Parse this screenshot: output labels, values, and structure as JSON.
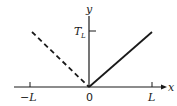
{
  "diagram": {
    "axes": {
      "x_label": "x",
      "y_label": "y"
    },
    "ticks": {
      "x_neg": "−L",
      "x_origin": "0",
      "x_pos": "L",
      "y_main": "T",
      "y_sub": "L"
    },
    "lines": [
      {
        "name": "solid-line",
        "style": "solid",
        "from": "origin",
        "to": "(L, T_L)"
      },
      {
        "name": "dashed-line",
        "style": "dashed",
        "from": "(-L, T_L)",
        "to": "origin"
      }
    ],
    "colors": {
      "stroke": "#1a1a1a",
      "background": "#ffffff"
    }
  }
}
